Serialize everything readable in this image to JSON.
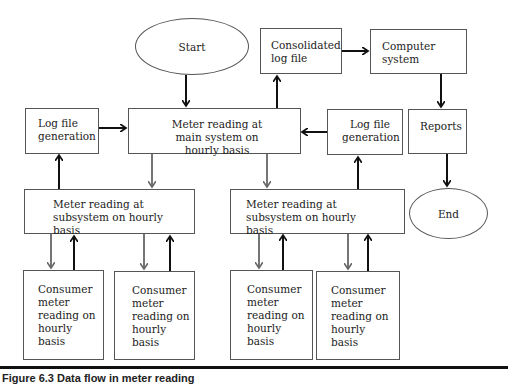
{
  "diagram": {
    "start": "Start",
    "end": "End",
    "main_system": "Meter reading at main system on hourly basis",
    "log_file_left": "Log file generation",
    "log_file_right": "Log file generation",
    "consolidated_log": "Consolidated log file",
    "computer_system": "Computer system",
    "reports": "Reports",
    "subsystem_left": "Meter reading at subsystem on hourly basis",
    "subsystem_right": "Meter reading at subsystem on hourly basis",
    "consumers": [
      "Consumer meter reading on hourly basis",
      "Consumer meter reading on hourly basis",
      "Consumer meter reading on hourly basis",
      "Consumer meter reading on hourly basis"
    ]
  },
  "caption": "Figure 6.3   Data flow in meter reading"
}
